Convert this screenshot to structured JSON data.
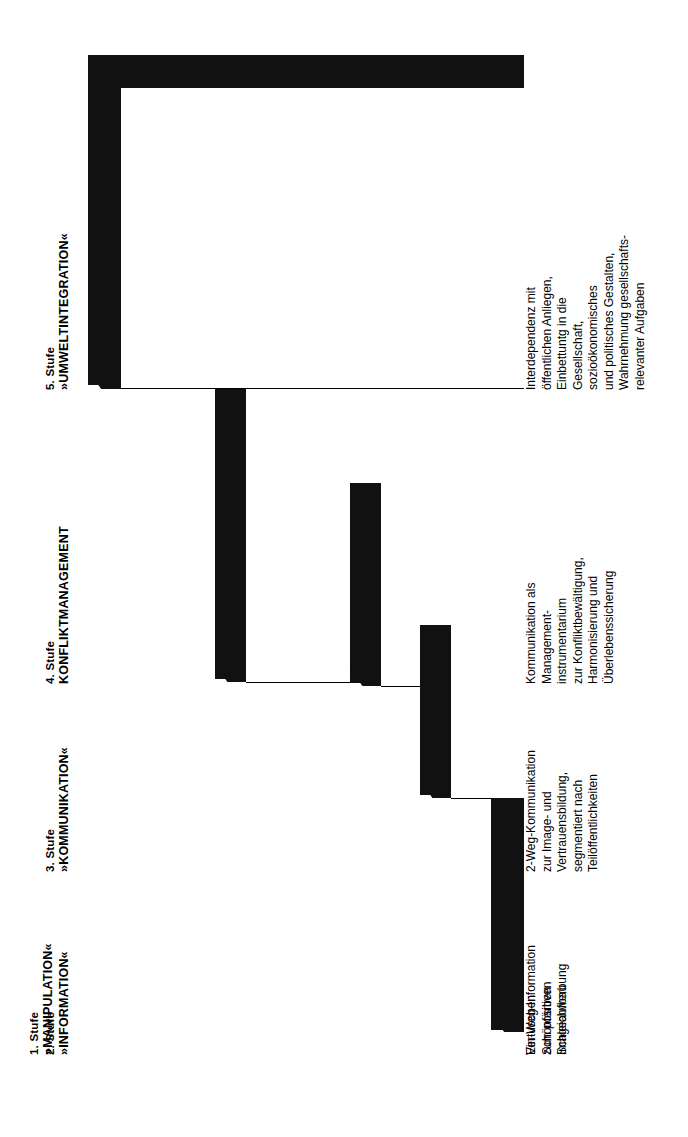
{
  "diagram": {
    "type": "staircase",
    "orientation": "rotated-90-ccw",
    "language": "de",
    "accent_color": "#111111",
    "background_color": "#ffffff",
    "steps": [
      {
        "number_label": "1. Stufe",
        "name_label": "»MANIPULATION«",
        "body_lines": [
          "Vertuschen",
          "Schönfärben",
          "Schleichwerbung"
        ]
      },
      {
        "number_label": "2. Stufe",
        "name_label": "»INFORMATION«",
        "body_lines": [
          "Ein-Weg-Information",
          "zum positiven",
          "Imageaufbau"
        ]
      },
      {
        "number_label": "3. Stufe",
        "name_label": "»KOMMUNIKATION«",
        "body_lines": [
          "2-Weg-Kommunikation",
          "zur Image- und",
          "Vertrauensbildung,",
          "segmentiert nach",
          "Teilöffentlichkeiten"
        ]
      },
      {
        "number_label": "4. Stufe",
        "name_label": "KONFLIKTMANAGEMENT",
        "body_lines": [
          "Kommunikation als",
          "Management-",
          "instrumentarium",
          "zur Konfliktbewältigung,",
          "Harmonisierung und",
          "Überlebenssicherung"
        ]
      },
      {
        "number_label": "5. Stufe",
        "name_label": "»UMWELTINTEGRATION«",
        "body_lines": [
          "Interdependenz mit",
          "öffentlichen Anliegen,",
          "Einbettuntg in die",
          "Gesellschaft,",
          "sozioökonomisches",
          "und politisches Gestalten,",
          "Wahrnehmung gesellschafts-",
          "relevanter Aufgaben"
        ]
      }
    ]
  }
}
